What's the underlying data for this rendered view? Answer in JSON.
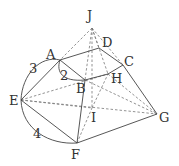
{
  "figure": {
    "points": {
      "J": {
        "x": 92,
        "y": 28,
        "lx": 87,
        "ly": 20
      },
      "D": {
        "x": 99,
        "y": 48,
        "lx": 102,
        "ly": 47
      },
      "A": {
        "x": 60,
        "y": 60,
        "lx": 46,
        "ly": 59
      },
      "C": {
        "x": 123,
        "y": 65,
        "lx": 125,
        "ly": 66
      },
      "B": {
        "x": 85,
        "y": 80,
        "lx": 76,
        "ly": 93
      },
      "H": {
        "x": 108,
        "y": 74,
        "lx": 111,
        "ly": 83
      },
      "E": {
        "x": 21,
        "y": 100,
        "lx": 9,
        "ly": 105
      },
      "I": {
        "x": 92,
        "y": 108,
        "lx": 89,
        "ly": 122
      },
      "G": {
        "x": 157,
        "y": 114,
        "lx": 159,
        "ly": 122
      },
      "F": {
        "x": 77,
        "y": 143,
        "lx": 71,
        "ly": 159
      }
    },
    "labels": {
      "J": "J",
      "D": "D",
      "A": "A",
      "C": "C",
      "B": "B",
      "H": "H",
      "E": "E",
      "I": "I",
      "G": "G",
      "F": "F"
    },
    "dimensions": {
      "AE": "3",
      "AB": "2",
      "EF": "4"
    },
    "solid_edges": [
      [
        "A",
        "D"
      ],
      [
        "D",
        "C"
      ],
      [
        "A",
        "B"
      ],
      [
        "B",
        "H"
      ],
      [
        "H",
        "C"
      ],
      [
        "A",
        "E"
      ],
      [
        "E",
        "F"
      ],
      [
        "B",
        "F"
      ],
      [
        "F",
        "G"
      ],
      [
        "C",
        "G"
      ]
    ],
    "dashed_edges": [
      [
        "J",
        "A"
      ],
      [
        "J",
        "D"
      ],
      [
        "J",
        "C"
      ],
      [
        "J",
        "B"
      ],
      [
        "J",
        "H"
      ],
      [
        "J",
        "I"
      ],
      [
        "E",
        "H"
      ],
      [
        "E",
        "G"
      ],
      [
        "E",
        "I"
      ],
      [
        "B",
        "G"
      ],
      [
        "H",
        "G"
      ],
      [
        "F",
        "I"
      ],
      [
        "I",
        "G"
      ],
      [
        "B",
        "I"
      ]
    ]
  }
}
